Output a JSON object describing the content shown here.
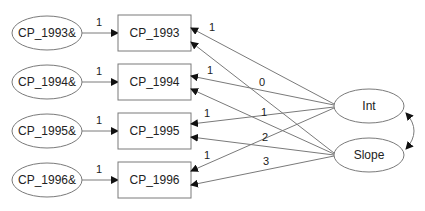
{
  "diagram": {
    "type": "path-diagram",
    "colors": {
      "stroke": "#7a7a7a",
      "text": "#222222",
      "arrowhead": "#111111",
      "background": "#ffffff"
    },
    "error_terms": [
      {
        "id": "e1993",
        "label": "CP_1993&"
      },
      {
        "id": "e1994",
        "label": "CP_1994&"
      },
      {
        "id": "e1995",
        "label": "CP_1995&"
      },
      {
        "id": "e1996",
        "label": "CP_1996&"
      }
    ],
    "observed": [
      {
        "id": "cp1993",
        "label": "CP_1993"
      },
      {
        "id": "cp1994",
        "label": "CP_1994"
      },
      {
        "id": "cp1995",
        "label": "CP_1995"
      },
      {
        "id": "cp1996",
        "label": "CP_1996"
      }
    ],
    "latent": [
      {
        "id": "int",
        "label": "Int"
      },
      {
        "id": "slope",
        "label": "Slope"
      }
    ],
    "error_loadings": [
      "1",
      "1",
      "1",
      "1"
    ],
    "int_loadings": [
      "1",
      "1",
      "1",
      "1"
    ],
    "slope_loadings": [
      "0",
      "1",
      "2",
      "3"
    ],
    "covariance": {
      "from": "Int",
      "to": "Slope"
    }
  }
}
